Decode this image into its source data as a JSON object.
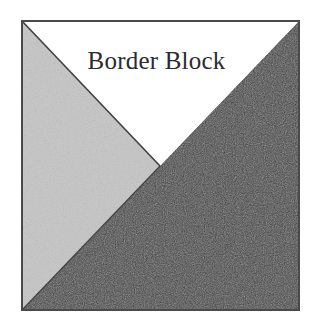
{
  "figure": {
    "title": "Border Block",
    "caption": "Border Block",
    "background_color": "#ffffff"
  },
  "block": {
    "name": "Border Block",
    "shape": "square",
    "border_color": "#4a4a4a",
    "border_width_px": 2,
    "bounds": {
      "x": 22,
      "y": 21,
      "width": 277,
      "height": 289
    },
    "center_point": {
      "x": 160,
      "y": 166
    },
    "patches": [
      {
        "id": "top-white-triangle",
        "label": "white triangle",
        "fill_color": "#ffffff",
        "tone": "light",
        "points": "22,21 299,21 160,166"
      },
      {
        "id": "left-light-gray-triangle",
        "label": "light gray triangle",
        "fill_color": "#e2e2e2",
        "tone": "light-gray",
        "points": "22,21 160,166 22,310"
      },
      {
        "id": "bottom-right-dark-triangle",
        "label": "dark triangle",
        "fill_color": "#2b2b2b",
        "tone": "dark",
        "points": "299,21 299,310 22,310 160,166"
      }
    ],
    "seam_lines": [
      {
        "id": "seam-top-left-diagonal",
        "from": "22,21",
        "to": "160,166",
        "color": "#3f3f3f"
      },
      {
        "id": "seam-bottom-left-diagonal",
        "from": "160,166",
        "to": "22,310",
        "color": "#3f3f3f"
      }
    ]
  }
}
